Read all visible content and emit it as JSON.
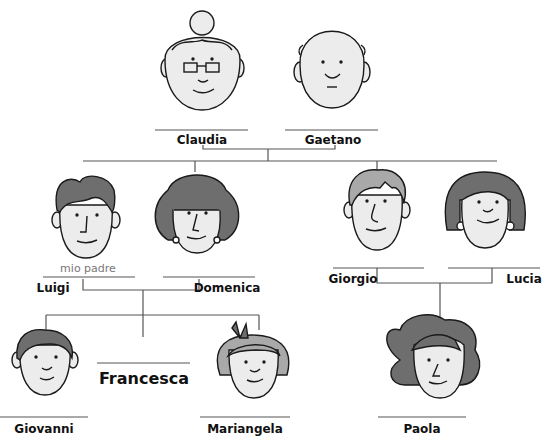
{
  "colors": {
    "line": "#555555",
    "face": "#ececec",
    "hair_dark": "#6e6e6e",
    "hair_light": "#a9a9a9",
    "stroke": "#1a1a1a"
  },
  "people": {
    "claudia": {
      "name": "Claudia"
    },
    "gaetano": {
      "name": "Gaetano"
    },
    "luigi": {
      "name": "Luigi",
      "note": "mio padre"
    },
    "domenica": {
      "name": "Domenica"
    },
    "giorgio": {
      "name": "Giorgio"
    },
    "lucia": {
      "name": "Lucia"
    },
    "giovanni": {
      "name": "Giovanni"
    },
    "francesca": {
      "name": "Francesca"
    },
    "mariangela": {
      "name": "Mariangela"
    },
    "paola": {
      "name": "Paola"
    }
  }
}
